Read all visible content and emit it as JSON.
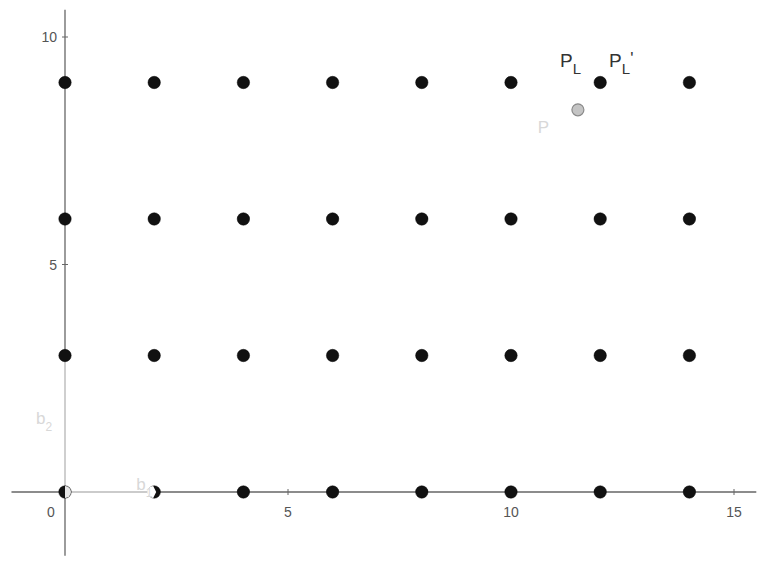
{
  "chart_data": {
    "type": "scatter",
    "title": "",
    "xlabel": "",
    "ylabel": "",
    "xlim": [
      -1.2,
      15.5
    ],
    "ylim": [
      -1.4,
      10.6
    ],
    "grid": false,
    "x_ticks": [
      0,
      5,
      10,
      15
    ],
    "y_ticks": [
      5,
      10
    ],
    "x_tick_labels": [
      "0",
      "5",
      "10",
      "15"
    ],
    "y_tick_labels": [
      "5",
      "10"
    ],
    "series": [
      {
        "name": "lattice points",
        "color": "#111111",
        "points": [
          [
            0,
            0
          ],
          [
            2,
            0
          ],
          [
            4,
            0
          ],
          [
            6,
            0
          ],
          [
            8,
            0
          ],
          [
            10,
            0
          ],
          [
            12,
            0
          ],
          [
            14,
            0
          ],
          [
            0,
            3
          ],
          [
            2,
            3
          ],
          [
            4,
            3
          ],
          [
            6,
            3
          ],
          [
            8,
            3
          ],
          [
            10,
            3
          ],
          [
            12,
            3
          ],
          [
            14,
            3
          ],
          [
            0,
            6
          ],
          [
            2,
            6
          ],
          [
            4,
            6
          ],
          [
            6,
            6
          ],
          [
            8,
            6
          ],
          [
            10,
            6
          ],
          [
            12,
            6
          ],
          [
            14,
            6
          ],
          [
            0,
            9
          ],
          [
            2,
            9
          ],
          [
            4,
            9
          ],
          [
            6,
            9
          ],
          [
            8,
            9
          ],
          [
            10,
            9
          ],
          [
            12,
            9
          ],
          [
            14,
            9
          ]
        ]
      },
      {
        "name": "P",
        "color": "#c4c4c4",
        "points": [
          [
            11.5,
            8.4
          ]
        ]
      }
    ],
    "vectors": [
      {
        "name": "b1",
        "from": [
          0,
          0
        ],
        "to": [
          2,
          0
        ],
        "color": "#e0e0e0"
      },
      {
        "name": "b2",
        "from": [
          0,
          0
        ],
        "to": [
          0,
          3
        ],
        "color": "#e0e0e0"
      }
    ],
    "annotations": [
      {
        "text": "P",
        "sub": "L",
        "suffix": "",
        "x": 11.1,
        "y": 9.35,
        "color": "#333333"
      },
      {
        "text": "P",
        "sub": "L",
        "suffix": "'",
        "x": 12.2,
        "y": 9.35,
        "color": "#333333"
      },
      {
        "text": "P",
        "sub": "",
        "suffix": "",
        "x": 10.6,
        "y": 7.9,
        "color": "#e0e0e0"
      },
      {
        "text": "b",
        "sub": "1",
        "suffix": "",
        "x": 1.6,
        "y": 0.05,
        "color": "#e0e0e0"
      },
      {
        "text": "b",
        "sub": "2",
        "suffix": "",
        "x": -0.65,
        "y": 1.5,
        "color": "#e0e0e0"
      }
    ]
  }
}
